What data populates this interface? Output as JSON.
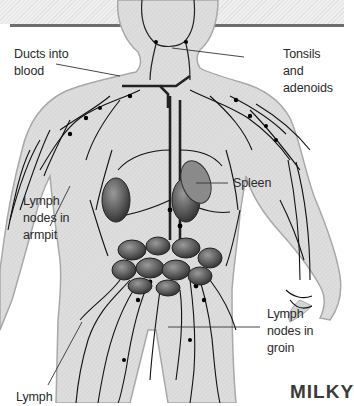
{
  "diagram": {
    "labels": [
      {
        "id": "ducts",
        "text": "Ducts into\nblood",
        "x": 14,
        "y": 46
      },
      {
        "id": "tonsils",
        "text": "Tonsils and\nadenoids",
        "x": 283,
        "y": 46
      },
      {
        "id": "spleen",
        "text": "Spleen",
        "x": 233,
        "y": 175
      },
      {
        "id": "armpit",
        "text": "Lymph\nnodes in\narmpit",
        "x": 23,
        "y": 193
      },
      {
        "id": "groin",
        "text": "Lymph\nnodes in\ngroin",
        "x": 267,
        "y": 306
      },
      {
        "id": "lymph",
        "text": "Lymph",
        "x": 16,
        "y": 389
      }
    ],
    "watermark": "MILKY",
    "colors": {
      "body_fill": "#dcdcdc",
      "body_outline": "#a8a8a8",
      "vessels": "#111111",
      "organs": "#555555",
      "rule": "#6e6e6e",
      "text": "#2a2a2a"
    }
  }
}
